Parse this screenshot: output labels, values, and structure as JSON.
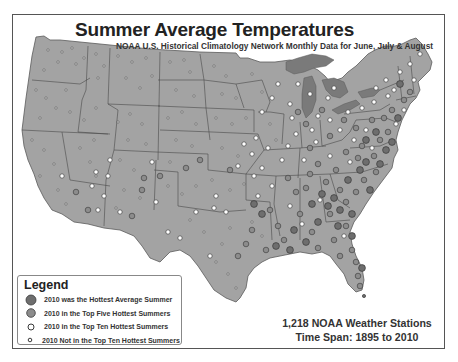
{
  "header": {
    "title": "Summer Average Temperatures",
    "subtitle": "NOAA U.S. Historical Climatology Network Monthly Data for June, July & August"
  },
  "legend": {
    "title": "Legend",
    "items": [
      {
        "label": "2010 was the Hottest Average Summer",
        "symbol": "large-dark-circle",
        "color": "#6e6e6e"
      },
      {
        "label": "2010 in the Top Five Hottest Summers",
        "symbol": "medium-gray-circle",
        "color": "#8c8c8c"
      },
      {
        "label": "2010 in the Top Ten Hottest Summers",
        "symbol": "small-white-circle",
        "color": "#ffffff"
      },
      {
        "label": "2010 Not in the Top Ten Hottest Summers",
        "symbol": "tiny-white-circle",
        "color": "#ffffff"
      }
    ]
  },
  "stats": {
    "stations": "1,218 NOAA Weather Stations",
    "timespan": "Time Span: 1895 to 2010"
  },
  "colors": {
    "land": "#a3a3a3",
    "water": "#7a7a7a",
    "border": "#4a4a4a",
    "frame": "#555555"
  }
}
